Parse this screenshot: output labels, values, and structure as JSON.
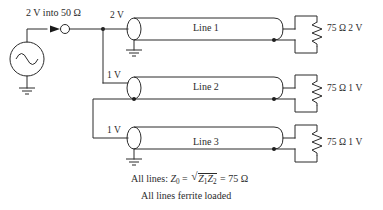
{
  "diagram": {
    "title_note": "2 V into 50 Ω",
    "source": {
      "name": "ac-voltage-source",
      "symbol": "sine-wave-in-circle",
      "drive_label": "2 V into 50 Ω"
    },
    "node_labels": {
      "line1_input": "2 V",
      "line2_input": "1 V",
      "line3_input": "1 V"
    },
    "lines": [
      {
        "label": "Line 1",
        "input_voltage": "2 V",
        "load": "75 Ω",
        "load_voltage": "2 V",
        "load_label": "75 Ω  2 V"
      },
      {
        "label": "Line 2",
        "input_voltage": "1 V",
        "load": "75 Ω",
        "load_voltage": "1 V",
        "load_label": "75 Ω  1 V"
      },
      {
        "label": "Line 3",
        "input_voltage": "1 V",
        "load": "75 Ω",
        "load_voltage": "1 V",
        "load_label": "75 Ω  1 V"
      }
    ],
    "formula": {
      "prefix": "All lines: ",
      "z0": "Z",
      "z0_sub": "0",
      "eq1": " = ",
      "radical": "√",
      "radicand_a": "Z",
      "radicand_a_sub": "1",
      "radicand_b": "Z",
      "radicand_b_sub": "2",
      "eq2": " = 75 Ω",
      "plain": "All lines: Z0 = √(Z1 Z2) = 75 Ω"
    },
    "footnote": "All lines ferrite loaded",
    "colors": {
      "ink": "#2b2b2b",
      "background": "#ffffff"
    }
  }
}
